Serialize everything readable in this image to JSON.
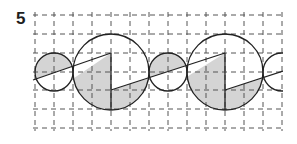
{
  "problem": {
    "number": "5"
  },
  "figure": {
    "grid": {
      "x_lines": [
        35,
        54,
        73,
        92,
        111,
        130,
        149,
        168,
        187,
        206,
        225,
        244,
        263,
        282
      ],
      "y_lines": [
        15,
        34,
        53,
        72,
        90,
        109,
        128
      ],
      "color": "#555555"
    },
    "shade_color": "#d4d4d4",
    "stroke_color": "#222222",
    "circles": [
      {
        "cx": 54,
        "cy": 72,
        "r": 19,
        "type": "small"
      },
      {
        "cx": 111,
        "cy": 72,
        "r": 38,
        "type": "large"
      },
      {
        "cx": 168,
        "cy": 72,
        "r": 19,
        "type": "small"
      },
      {
        "cx": 225,
        "cy": 72,
        "r": 38,
        "type": "large"
      },
      {
        "cx": 282,
        "cy": 72,
        "r": 19,
        "type": "small-partial"
      }
    ]
  }
}
